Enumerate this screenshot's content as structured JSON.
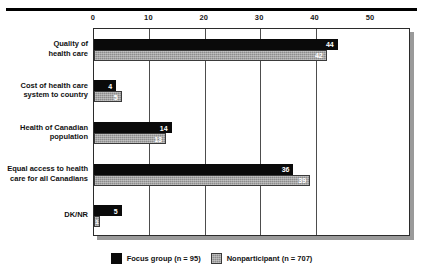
{
  "chart_data": {
    "type": "bar",
    "orientation": "horizontal",
    "title": "",
    "subtitle": "",
    "xlabel": "",
    "ylabel": "",
    "xlim": [
      0,
      50
    ],
    "xticks": [
      0,
      10,
      20,
      30,
      40,
      50
    ],
    "xtick_labels": [
      "0",
      "10",
      "20",
      "30",
      "40",
      "50"
    ],
    "grid": "vertical",
    "legend_position": "bottom-center",
    "categories": [
      "Quality of\nhealth care",
      "Cost of health care\nsystem to country",
      "Health of Canadian\npopulation",
      "Equal access to health\ncare for all Canadians",
      "DK/NR"
    ],
    "series": [
      {
        "name": "Focus group (n = 95)",
        "color": "#0a0a0a",
        "values": [
          44,
          4,
          14,
          36,
          5
        ],
        "value_labels": [
          "44",
          "4",
          "14",
          "36",
          "5"
        ]
      },
      {
        "name": "Nonparticipant (n = 707)",
        "color": "#8c8c8c",
        "values": [
          42,
          5,
          13,
          39,
          1
        ],
        "value_labels": [
          "42",
          "5",
          "13",
          "39",
          "1"
        ]
      }
    ]
  },
  "legend": {
    "items": [
      {
        "label": "Focus group (n = 95)",
        "swatch": "focus"
      },
      {
        "label": "Nonparticipant (n = 707)",
        "swatch": "nonp"
      }
    ]
  },
  "colors": {
    "focus_group": "#0a0a0a",
    "nonparticipant": "#8c8c8c",
    "frame": "#2b2b2b",
    "gridline": "#4d4d4d",
    "background": "#ffffff"
  }
}
